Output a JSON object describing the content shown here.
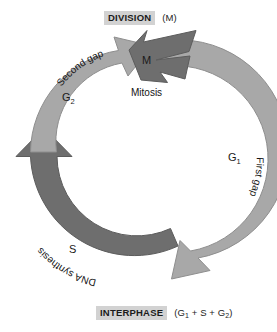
{
  "diagram": {
    "type": "cycle-diagram",
    "colors": {
      "light_band": "#a8a8a8",
      "dark_band": "#6e6e6e",
      "band_stroke": "#8a8a8a",
      "caption_highlight": "#d2d2d2",
      "text": "#1b1b1b",
      "background": "#ffffff"
    }
  },
  "captions": {
    "division": {
      "title": "DIVISION",
      "note": "(M)"
    },
    "interphase": {
      "title": "INTERPHASE",
      "note_prefix": "(G",
      "note_sub1": "1",
      "note_mid": " + S + G",
      "note_sub2": "2",
      "note_suffix": ")"
    }
  },
  "phases": [
    {
      "id": "m",
      "symbol": "M",
      "name": "Mitosis",
      "band": "dark",
      "position": "top",
      "symbol_color": "#f2f2f2"
    },
    {
      "id": "g1",
      "symbol": "G",
      "subscript": "1",
      "name": "First gap",
      "band": "light",
      "position": "right",
      "symbol_color": "#1a1a1a"
    },
    {
      "id": "s",
      "symbol": "S",
      "name": "DNA synthesis",
      "band": "dark",
      "position": "bottom-left",
      "symbol_color": "#e8e8e8"
    },
    {
      "id": "g2",
      "symbol": "G",
      "subscript": "2",
      "name": "Second gap",
      "band": "light",
      "position": "upper-left",
      "symbol_color": "#1a1a1a"
    }
  ]
}
